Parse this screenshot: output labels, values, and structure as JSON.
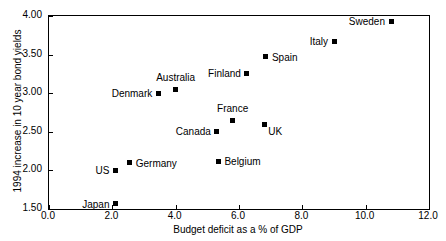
{
  "chart_data": {
    "type": "scatter",
    "title": "",
    "xlabel": "Budget deficit as a % of GDP",
    "ylabel": "1994 increase in 10 year bond yields",
    "xlim": [
      0.0,
      12.0
    ],
    "ylim": [
      1.5,
      4.0
    ],
    "xticks": [
      "0.0",
      "2.0",
      "4.0",
      "6.0",
      "8.0",
      "10.0",
      "12.0"
    ],
    "xtick_values": [
      0.0,
      2.0,
      4.0,
      6.0,
      8.0,
      10.0,
      12.0
    ],
    "yticks": [
      "1.50",
      "2.00",
      "2.50",
      "3.00",
      "3.50",
      "4.00"
    ],
    "ytick_values": [
      1.5,
      2.0,
      2.5,
      3.0,
      3.5,
      4.0
    ],
    "grid": false,
    "legend": "none",
    "marker_color": "#000000",
    "frame_color": "#000000",
    "background": "#ffffff",
    "points": [
      {
        "label": "Japan",
        "x": 2.1,
        "y": 1.57,
        "label_pos": "left"
      },
      {
        "label": "US",
        "x": 2.1,
        "y": 2.0,
        "label_pos": "left"
      },
      {
        "label": "Germany",
        "x": 2.55,
        "y": 2.1,
        "label_pos": "right"
      },
      {
        "label": "Denmark",
        "x": 3.45,
        "y": 3.0,
        "label_pos": "left"
      },
      {
        "label": "Australia",
        "x": 4.0,
        "y": 3.05,
        "label_pos": "above"
      },
      {
        "label": "Belgium",
        "x": 5.35,
        "y": 2.12,
        "label_pos": "right"
      },
      {
        "label": "Canada",
        "x": 5.3,
        "y": 2.51,
        "label_pos": "left"
      },
      {
        "label": "France",
        "x": 5.8,
        "y": 2.65,
        "label_pos": "above"
      },
      {
        "label": "Finland",
        "x": 6.25,
        "y": 3.26,
        "label_pos": "left"
      },
      {
        "label": "UK",
        "x": 6.8,
        "y": 2.6,
        "label_pos": "below-right"
      },
      {
        "label": "Spain",
        "x": 6.85,
        "y": 3.47,
        "label_pos": "right"
      },
      {
        "label": "Italy",
        "x": 9.0,
        "y": 3.67,
        "label_pos": "left"
      },
      {
        "label": "Sweden",
        "x": 10.8,
        "y": 3.93,
        "label_pos": "left"
      }
    ]
  }
}
